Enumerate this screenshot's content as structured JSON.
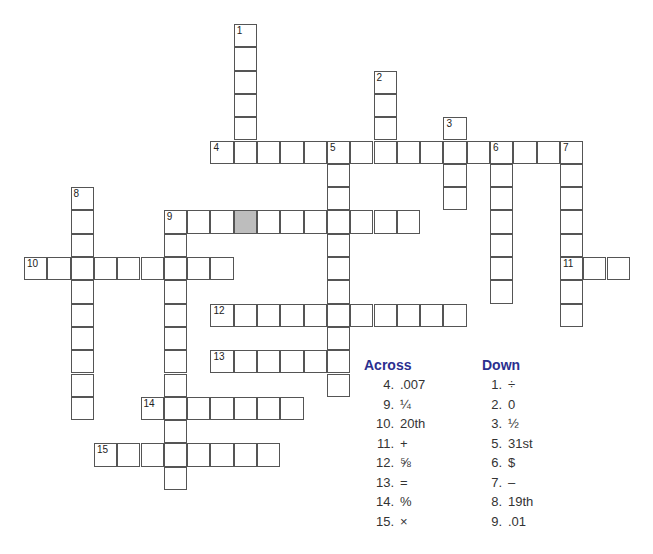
{
  "puzzle": {
    "cell_size": 23.3,
    "origin_x": 24,
    "origin_y": 24,
    "words": [
      {
        "num": "1",
        "dir": "down",
        "col": 9,
        "row": 0,
        "len": 6
      },
      {
        "num": "2",
        "dir": "down",
        "col": 15,
        "row": 2,
        "len": 4
      },
      {
        "num": "3",
        "dir": "down",
        "col": 18,
        "row": 4,
        "len": 4
      },
      {
        "num": "4",
        "dir": "across",
        "col": 8,
        "row": 5,
        "len": 16
      },
      {
        "num": "5",
        "dir": "down",
        "col": 13,
        "row": 5,
        "len": 11
      },
      {
        "num": "6",
        "dir": "down",
        "col": 20,
        "row": 5,
        "len": 7
      },
      {
        "num": "7",
        "dir": "down",
        "col": 23,
        "row": 5,
        "len": 8
      },
      {
        "num": "8",
        "dir": "down",
        "col": 2,
        "row": 7,
        "len": 10
      },
      {
        "num": "9",
        "dir": "across",
        "col": 6,
        "row": 8,
        "len": 11
      },
      {
        "num": "9",
        "dir": "down",
        "col": 6,
        "row": 8,
        "len": 12
      },
      {
        "num": "10",
        "dir": "across",
        "col": 0,
        "row": 10,
        "len": 9
      },
      {
        "num": "11",
        "dir": "across",
        "col": 23,
        "row": 10,
        "len": 3
      },
      {
        "num": "12",
        "dir": "across",
        "col": 8,
        "row": 12,
        "len": 11
      },
      {
        "num": "13",
        "dir": "across",
        "col": 8,
        "row": 14,
        "len": 6
      },
      {
        "num": "14",
        "dir": "across",
        "col": 5,
        "row": 16,
        "len": 7
      },
      {
        "num": "15",
        "dir": "across",
        "col": 3,
        "row": 18,
        "len": 8
      }
    ],
    "shaded": [
      {
        "col": 9,
        "row": 8
      }
    ]
  },
  "clues": {
    "across_title": "Across",
    "down_title": "Down",
    "across": [
      {
        "n": "4.",
        "text": ".007"
      },
      {
        "n": "9.",
        "text": "¼"
      },
      {
        "n": "10.",
        "text": "20th"
      },
      {
        "n": "11.",
        "text": "+"
      },
      {
        "n": "12.",
        "text": "⅝"
      },
      {
        "n": "13.",
        "text": "="
      },
      {
        "n": "14.",
        "text": "%"
      },
      {
        "n": "15.",
        "text": "×"
      }
    ],
    "down": [
      {
        "n": "1.",
        "text": "÷"
      },
      {
        "n": "2.",
        "text": "0"
      },
      {
        "n": "3.",
        "text": "½"
      },
      {
        "n": "5.",
        "text": "31st"
      },
      {
        "n": "6.",
        "text": "$"
      },
      {
        "n": "7.",
        "text": "–"
      },
      {
        "n": "8.",
        "text": "19th"
      },
      {
        "n": "9.",
        "text": ".01"
      }
    ]
  }
}
